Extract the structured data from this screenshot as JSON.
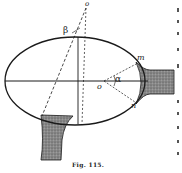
{
  "figure": {
    "caption": "Fig. 115.",
    "labels": {
      "o_top": "o",
      "beta": "β",
      "m": "m",
      "n": "n",
      "o_center": "o",
      "alpha": "α"
    }
  },
  "colors": {
    "ink": "#1a1a1a",
    "shade": "#7a7a7a",
    "paper": "#ffffff"
  }
}
